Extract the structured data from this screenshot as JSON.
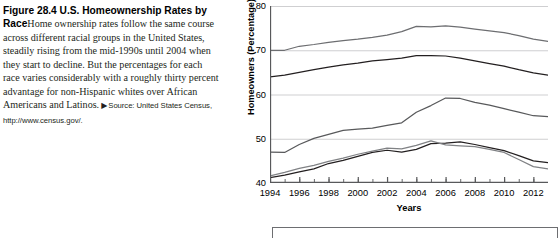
{
  "caption": {
    "lead": "Figure 28.4  U.S. Homeownership Rates by Race",
    "body": "Home ownership rates follow the same course across different racial groups in the United States, steadily rising from the mid-1990s until 2004 when they start to decline. But the percentages for each race varies considerably with a roughly thirty percent advantage for non-Hispanic whites over African Americans and Latinos.",
    "source_marker": "▶",
    "source": "Source: United States Census, http://www.census.gov/."
  },
  "chart_data": {
    "type": "line",
    "title": "",
    "xlabel": "Years",
    "ylabel": "Homeowners (Percentage)",
    "ylim": [
      40,
      80
    ],
    "xlim": [
      1994,
      2013
    ],
    "ytick_labels": [
      "40",
      "50",
      "60",
      "70",
      "80"
    ],
    "yticks": [
      40,
      50,
      60,
      70,
      80
    ],
    "xtick_labels": [
      "1994",
      "1996",
      "1998",
      "2000",
      "2002",
      "2004",
      "2006",
      "2008",
      "2010",
      "2012"
    ],
    "xticks": [
      1994,
      1996,
      1998,
      2000,
      2002,
      2004,
      2006,
      2008,
      2010,
      2012
    ],
    "minor_xticks_every": 1,
    "grid": "horizontal",
    "legend_position": "below-plot",
    "legend_entries": [],
    "x": [
      1994,
      1995,
      1996,
      1997,
      1998,
      1999,
      2000,
      2001,
      2002,
      2003,
      2004,
      2005,
      2006,
      2007,
      2008,
      2009,
      2010,
      2011,
      2012,
      2013
    ],
    "series": [
      {
        "name": "series-1",
        "color": "#6d6e71",
        "values": [
          70.0,
          70.0,
          70.9,
          71.3,
          71.8,
          72.2,
          72.5,
          72.9,
          73.4,
          74.2,
          75.4,
          75.3,
          75.5,
          75.2,
          74.8,
          74.4,
          74.0,
          73.3,
          72.5,
          72.0
        ]
      },
      {
        "name": "series-2",
        "color": "#231f20",
        "values": [
          64.0,
          64.4,
          65.0,
          65.6,
          66.2,
          66.7,
          67.1,
          67.6,
          67.9,
          68.2,
          68.8,
          68.8,
          68.7,
          68.2,
          67.6,
          67.0,
          66.4,
          65.6,
          64.9,
          64.4
        ]
      },
      {
        "name": "series-3",
        "color": "#58595b",
        "values": [
          47.0,
          46.9,
          48.7,
          50.1,
          51.0,
          51.9,
          52.2,
          52.4,
          53.0,
          53.6,
          56.0,
          57.5,
          59.2,
          59.1,
          58.2,
          57.6,
          56.8,
          56.0,
          55.2,
          55.0
        ]
      },
      {
        "name": "series-4",
        "color": "#231f20",
        "values": [
          41.2,
          41.8,
          42.5,
          43.2,
          44.4,
          45.1,
          46.0,
          46.9,
          47.4,
          47.0,
          47.6,
          48.9,
          49.0,
          49.3,
          48.7,
          48.0,
          47.3,
          46.2,
          45.0,
          44.6
        ]
      },
      {
        "name": "series-5",
        "color": "#808285",
        "values": [
          41.6,
          42.4,
          43.3,
          44.0,
          44.9,
          45.6,
          46.5,
          47.2,
          47.9,
          47.7,
          48.5,
          49.5,
          48.6,
          48.4,
          48.2,
          47.6,
          46.9,
          45.3,
          43.7,
          43.2
        ]
      }
    ]
  }
}
